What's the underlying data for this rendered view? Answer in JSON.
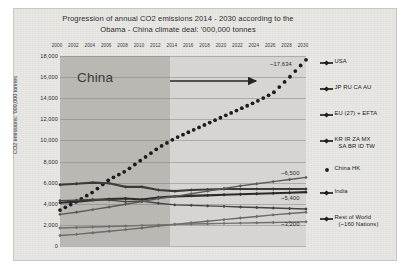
{
  "chart_data": {
    "type": "line",
    "title": "Progression of annual CO2 emissions 2014 - 2030 according to the",
    "title_line2": "Obama - China climate deal:  '000,000 tonnes",
    "xlabel": "",
    "ylabel": "CO2 emissions: '000,000 tonnes",
    "ylim": [
      0,
      18000
    ],
    "ytick_labels": [
      "18,000",
      "16,000",
      "14,000",
      "12,000",
      "10,000",
      "8,000",
      "6,000",
      "4,000",
      "2,000",
      "0"
    ],
    "ytick_values": [
      18000,
      16000,
      14000,
      12000,
      10000,
      8000,
      6000,
      4000,
      2000,
      0
    ],
    "grid": true,
    "legend_position": "right",
    "x": [
      2000,
      2002,
      2004,
      2006,
      2008,
      2010,
      2012,
      2014,
      2016,
      2018,
      2020,
      2022,
      2024,
      2026,
      2028,
      2030
    ],
    "xtick_labels": [
      "2000",
      "2002",
      "2004",
      "2006",
      "2008",
      "2010",
      "2012",
      "2014",
      "2016",
      "2018",
      "2020",
      "2022",
      "2024",
      "2026",
      "2028",
      "2030"
    ],
    "shaded_regions": [
      {
        "label": "historical",
        "from": 2000,
        "to": 2014,
        "color": "#b9b8b3"
      },
      {
        "label": "projected",
        "from": 2014,
        "to": 2030,
        "color": "#d6d5d1"
      }
    ],
    "annotations": [
      {
        "text": "China",
        "series": "China HK",
        "arrow": "right"
      }
    ],
    "series": [
      {
        "name": "China HK",
        "marker": "dot",
        "style": "dotted",
        "color": "#1c1c1c",
        "end_label": "~17,634",
        "values": [
          3400,
          4200,
          5100,
          6300,
          7100,
          8200,
          9300,
          10200,
          10900,
          11600,
          12300,
          13000,
          13700,
          14500,
          16000,
          17634
        ]
      },
      {
        "name": "USA",
        "marker": "diamond",
        "style": "solid",
        "color": "#3a3a3a",
        "end_label": "~5,400",
        "values": [
          5800,
          5900,
          6000,
          5950,
          5600,
          5600,
          5300,
          5200,
          5300,
          5350,
          5400,
          5400,
          5400,
          5400,
          5400,
          5400
        ]
      },
      {
        "name": "JP RU CA AU",
        "marker": "diamond",
        "style": "solid",
        "color": "#2a2a2a",
        "end_label": "",
        "values": [
          4100,
          4200,
          4350,
          4450,
          4500,
          4400,
          4600,
          4700,
          4750,
          4800,
          4850,
          4900,
          4950,
          5000,
          5050,
          5100
        ]
      },
      {
        "name": "EU (27) + EFTA",
        "marker": "diamond",
        "style": "solid",
        "color": "#444444",
        "end_label": "",
        "values": [
          4300,
          4350,
          4400,
          4350,
          4200,
          4250,
          4050,
          3900,
          3850,
          3800,
          3750,
          3700,
          3650,
          3600,
          3550,
          3500
        ]
      },
      {
        "name": "KR IR ZA MX SA BR ID TW",
        "marker": "diamond",
        "style": "solid",
        "color": "#5a5a5a",
        "end_label": "~6,500",
        "values": [
          3000,
          3200,
          3450,
          3700,
          3950,
          4200,
          4500,
          4700,
          4950,
          5200,
          5450,
          5700,
          5900,
          6100,
          6300,
          6500
        ]
      },
      {
        "name": "India",
        "marker": "diamond",
        "style": "solid",
        "color": "#6a6a6a",
        "end_label": "~3,200",
        "values": [
          1000,
          1100,
          1250,
          1400,
          1550,
          1700,
          1900,
          2050,
          2200,
          2350,
          2500,
          2650,
          2800,
          2950,
          3080,
          3200
        ]
      },
      {
        "name": "Rest of World (~160 Nations)",
        "marker": "diamond",
        "style": "solid",
        "color": "#707070",
        "end_label": "",
        "values": [
          1700,
          1750,
          1800,
          1850,
          1900,
          1950,
          2000,
          2050,
          2080,
          2110,
          2140,
          2170,
          2200,
          2230,
          2260,
          2300
        ]
      }
    ]
  },
  "legend": {
    "items": [
      {
        "label": "USA",
        "label2": "",
        "marker": "line-diamond-marker"
      },
      {
        "label": "JP RU CA AU",
        "label2": "",
        "marker": "line-diamond-marker"
      },
      {
        "label": "EU (27) + EFTA",
        "label2": "",
        "marker": "line-diamond-marker"
      },
      {
        "label": "KR IR ZA MX",
        "label2": "SA BR ID TW",
        "marker": "line-diamond-marker"
      },
      {
        "label": "China HK",
        "label2": "",
        "marker": "dot-marker"
      },
      {
        "label": "India",
        "label2": "",
        "marker": "line-diamond-marker"
      },
      {
        "label": "Rest of World",
        "label2": "(~160 Nations)",
        "marker": "line-diamond-marker"
      }
    ]
  },
  "point_labels": [
    {
      "text": "~17,634"
    },
    {
      "text": "~6,500"
    },
    {
      "text": "~5,400"
    },
    {
      "text": "~3,200"
    }
  ]
}
